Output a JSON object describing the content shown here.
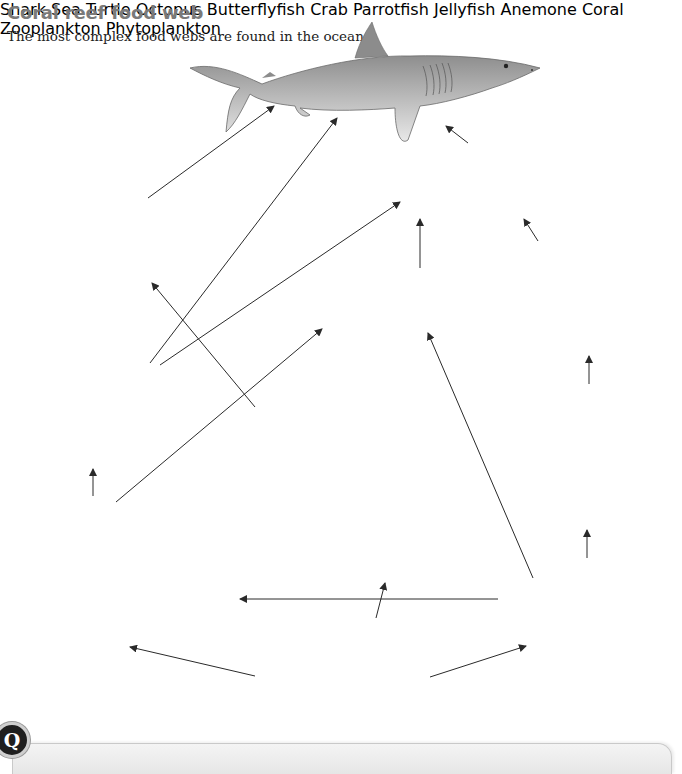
{
  "header": {
    "title": "Coral reef food web",
    "subtitle": "The most complex food webs are found in the ocean."
  },
  "organisms": {
    "shark": "Shark",
    "octopus": "Octopus",
    "sea_turtle": "Sea Turtle",
    "butterflyfish": "Butterflyfish",
    "crab": "Crab",
    "parrotfish": "Parrotfish",
    "jellyfish": "Jellyfish",
    "anemone": "Anemone",
    "coral": "Coral",
    "zooplankton": "Zooplankton",
    "phytoplankton": "Phytoplankton"
  },
  "food_web_links": [
    {
      "from": "Sea Turtle",
      "to": "Shark"
    },
    {
      "from": "Parrotfish",
      "to": "Shark"
    },
    {
      "from": "Octopus",
      "to": "Shark"
    },
    {
      "from": "Parrotfish",
      "to": "Octopus"
    },
    {
      "from": "Butterflyfish",
      "to": "Octopus"
    },
    {
      "from": "Crab",
      "to": "Octopus"
    },
    {
      "from": "Jellyfish",
      "to": "Sea Turtle"
    },
    {
      "from": "Coral",
      "to": "Parrotfish"
    },
    {
      "from": "Coral",
      "to": "Butterflyfish"
    },
    {
      "from": "Zooplankton",
      "to": "Butterflyfish"
    },
    {
      "from": "Anemone",
      "to": "Crab"
    },
    {
      "from": "Zooplankton",
      "to": "Anemone"
    },
    {
      "from": "Zooplankton",
      "to": "Coral"
    },
    {
      "from": "Phytoplankton",
      "to": "Jellyfish"
    },
    {
      "from": "Phytoplankton",
      "to": "Coral"
    },
    {
      "from": "Phytoplankton",
      "to": "Zooplankton"
    }
  ],
  "question_box": {
    "badge": "Q"
  },
  "colors": {
    "title": "#7a7a7a",
    "text": "#222222",
    "arrow": "#2a2a2a",
    "illustration_gray": "#8c8c8c"
  }
}
